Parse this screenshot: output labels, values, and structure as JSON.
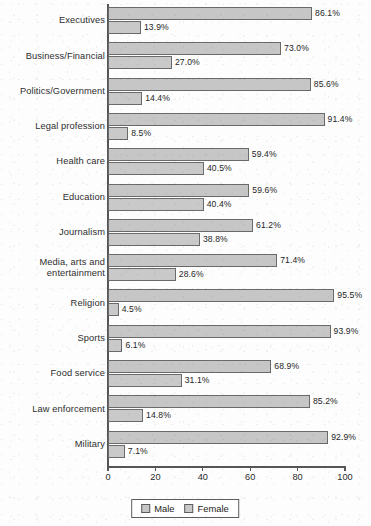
{
  "chart_data": {
    "type": "bar",
    "orientation": "horizontal",
    "grouped": true,
    "title": "",
    "subtitle": "",
    "xlabel": "",
    "ylabel": "",
    "xlim": [
      0,
      100
    ],
    "xticks": [
      "0",
      "20",
      "40",
      "60",
      "80",
      "100"
    ],
    "grid": false,
    "legend_position": "bottom-center",
    "value_suffix": "%",
    "categories": [
      "Executives",
      "Business/Financial",
      "Politics/Government",
      "Legal profession",
      "Health care",
      "Education",
      "Journalism",
      "Media, arts and\nentertainment",
      "Religion",
      "Sports",
      "Food service",
      "Law enforcement",
      "Military"
    ],
    "series": [
      {
        "name": "Male",
        "color": "#c6c6c6",
        "values": [
          86.1,
          73.0,
          85.6,
          91.4,
          59.4,
          59.6,
          61.2,
          71.4,
          95.5,
          93.9,
          68.9,
          85.2,
          92.9
        ],
        "labels": [
          "86.1%",
          "73.0%",
          "85.6%",
          "91.4%",
          "59.4%",
          "59.6%",
          "61.2%",
          "71.4%",
          "95.5%",
          "93.9%",
          "68.9%",
          "85.2%",
          "92.9%"
        ]
      },
      {
        "name": "Female",
        "color": "#c9c9c9",
        "values": [
          13.9,
          27.0,
          14.4,
          8.5,
          40.5,
          40.4,
          38.8,
          28.6,
          4.5,
          6.1,
          31.1,
          14.8,
          7.1
        ],
        "labels": [
          "13.9%",
          "27.0%",
          "14.4%",
          "8.5%",
          "40.5%",
          "40.4%",
          "38.8%",
          "28.6%",
          "4.5%",
          "6.1%",
          "31.1%",
          "14.8%",
          "7.1%"
        ]
      }
    ]
  },
  "legend": {
    "items": [
      {
        "label": "Male",
        "color": "#c6c6c6"
      },
      {
        "label": "Female",
        "color": "#c9c9c9"
      }
    ]
  }
}
